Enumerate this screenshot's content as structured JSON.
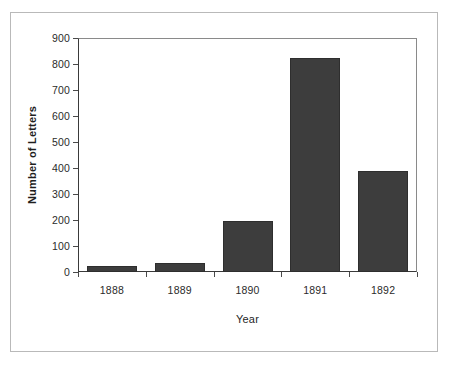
{
  "chart_data": {
    "type": "bar",
    "title": "",
    "xlabel": "Year",
    "ylabel": "Number of Letters",
    "categories": [
      "1888",
      "1889",
      "1890",
      "1891",
      "1892"
    ],
    "values": [
      23,
      33,
      195,
      825,
      390
    ],
    "ylim": [
      0,
      900
    ],
    "ytick_step": 100,
    "yticks": [
      "900",
      "800",
      "700",
      "600",
      "500",
      "400",
      "300",
      "200",
      "100",
      "0"
    ],
    "grid": false,
    "legend": false,
    "bar_color": "#3d3d3d",
    "axis_color": "#3a3a3a",
    "background": "#ffffff"
  }
}
